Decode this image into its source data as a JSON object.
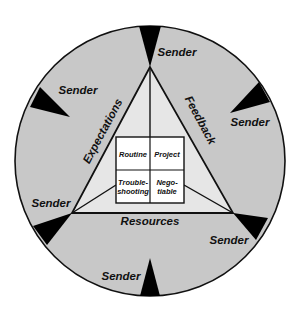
{
  "diagram": {
    "colors": {
      "background": "#ffffff",
      "ring_fill": "#c8c8c8",
      "triangle_fill": "#e6e6e6",
      "box_fill": "#ffffff",
      "wedge_fill": "#000000",
      "stroke": "#111111"
    },
    "senders": [
      {
        "label": "Sender",
        "position": "upper-left"
      },
      {
        "label": "Sender",
        "position": "top-right"
      },
      {
        "label": "Sender",
        "position": "right"
      },
      {
        "label": "Sender",
        "position": "left"
      },
      {
        "label": "Sender",
        "position": "lower-right"
      },
      {
        "label": "Sender",
        "position": "bottom"
      }
    ],
    "triangle_sides": {
      "left": "Expectations",
      "right": "Feedback",
      "bottom": "Resources"
    },
    "center_grid": {
      "cells": [
        {
          "line1": "Routine",
          "line2": ""
        },
        {
          "line1": "Project",
          "line2": ""
        },
        {
          "line1": "Trouble-",
          "line2": "shooting"
        },
        {
          "line1": "Nego-",
          "line2": "tiable"
        }
      ]
    }
  }
}
